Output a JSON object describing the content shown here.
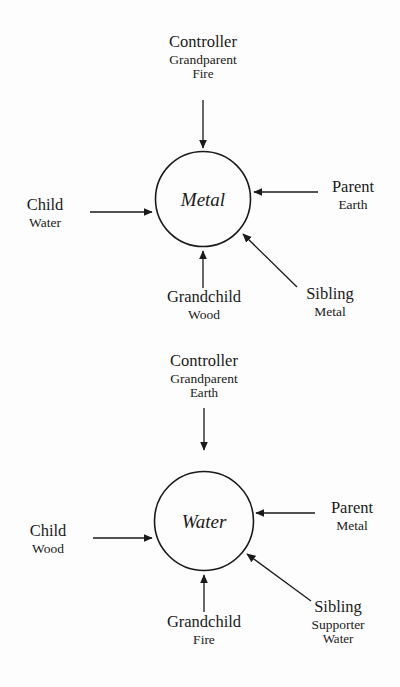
{
  "diagram": {
    "type": "five-element-relationship-diagram",
    "background_color": "#fdfdfd",
    "stroke_color": "#1a1a1a",
    "nodes": [
      {
        "id": "metal",
        "label": "Metal",
        "relations": {
          "top": {
            "line1": "Controller",
            "line2": "Grandparent",
            "line3": "Fire",
            "direction": "into-node-downward"
          },
          "left": {
            "line1": "Child",
            "line2": "Water",
            "direction": "into-node-rightward"
          },
          "right": {
            "line1": "Parent",
            "line2": "Earth",
            "direction": "into-node-leftward"
          },
          "bottom": {
            "line1": "Grandchild",
            "line2": "Wood",
            "direction": "into-node-upward"
          },
          "bottom_right": {
            "line1": "Sibling",
            "line2": "Metal",
            "direction": "into-node-diagonal-up-left"
          }
        }
      },
      {
        "id": "water",
        "label": "Water",
        "relations": {
          "top": {
            "line1": "Controller",
            "line2": "Grandparent",
            "line3": "Earth",
            "direction": "into-node-downward"
          },
          "left": {
            "line1": "Child",
            "line2": "Wood",
            "direction": "into-node-rightward"
          },
          "right": {
            "line1": "Parent",
            "line2": "Metal",
            "direction": "into-node-leftward"
          },
          "bottom": {
            "line1": "Grandchild",
            "line2": "Fire",
            "direction": "into-node-upward"
          },
          "bottom_right": {
            "line1": "Sibling",
            "line2": "Supporter",
            "line3": "Water",
            "direction": "into-node-diagonal-up-left"
          }
        }
      }
    ]
  }
}
